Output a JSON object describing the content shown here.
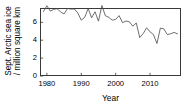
{
  "figure": {
    "background_color": "#ffffff",
    "axis_color": "#3a3a3a",
    "line_color": "#4a4a4a"
  },
  "chart_data": {
    "type": "line",
    "title": "",
    "xlabel": "Year",
    "ylabel": "Sept. Arctic sea ice / million square km",
    "ylabel_line1": "Sept. Arctic sea ice",
    "ylabel_line2": "/ million square km",
    "xlim": [
      1978,
      2019
    ],
    "ylim": [
      0,
      7.6
    ],
    "xticks": [
      1980,
      1990,
      2000,
      2010
    ],
    "xticklabels": [
      "1980",
      "1990",
      "2000",
      "2010"
    ],
    "yticks": [
      0,
      2,
      4,
      6
    ],
    "yticklabels": [
      "0",
      "2",
      "4",
      "6"
    ],
    "grid": false,
    "legend": null,
    "series": [
      {
        "name": "September Arctic sea ice extent",
        "x": [
          1979,
          1980,
          1981,
          1982,
          1983,
          1984,
          1985,
          1986,
          1987,
          1988,
          1989,
          1990,
          1991,
          1992,
          1993,
          1994,
          1995,
          1996,
          1997,
          1998,
          1999,
          2000,
          2001,
          2002,
          2003,
          2004,
          2005,
          2006,
          2007,
          2008,
          2009,
          2010,
          2011,
          2012,
          2013,
          2014,
          2015,
          2016,
          2017,
          2018
        ],
        "values": [
          7.2,
          7.85,
          7.25,
          7.45,
          7.52,
          7.17,
          6.93,
          7.54,
          7.48,
          7.49,
          7.04,
          6.24,
          6.55,
          7.55,
          6.5,
          7.18,
          6.13,
          7.88,
          6.74,
          6.56,
          6.24,
          6.32,
          6.75,
          5.96,
          6.15,
          6.05,
          5.57,
          5.92,
          4.3,
          4.73,
          5.39,
          4.93,
          4.63,
          3.63,
          5.35,
          5.28,
          4.63,
          4.72,
          4.87,
          4.71
        ]
      }
    ]
  }
}
